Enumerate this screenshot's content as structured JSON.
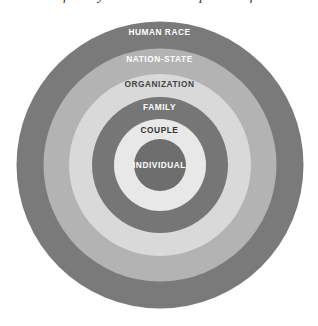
{
  "caption": {
    "text": "Figure 1.1  Levels of analysis: the nested spheres of human association"
  },
  "diagram": {
    "type": "concentric-circles",
    "rings": [
      {
        "id": "human-race",
        "label": "HUMAN RACE",
        "level": 1,
        "diameter_px": 287,
        "fill": "#7a7a7a",
        "text_color": "#ffffff",
        "label_offset_px": 6
      },
      {
        "id": "nation-state",
        "label": "NATION-STATE",
        "level": 2,
        "diameter_px": 233,
        "fill": "#b3b3b3",
        "text_color": "#ffffff",
        "label_offset_px": 6
      },
      {
        "id": "organization",
        "label": "ORGANIZATION",
        "level": 3,
        "diameter_px": 182,
        "fill": "#d9d9d9",
        "text_color": "#404040",
        "label_offset_px": 6
      },
      {
        "id": "family",
        "label": "FAMILY",
        "level": 4,
        "diameter_px": 136,
        "fill": "#767676",
        "text_color": "#ffffff",
        "label_offset_px": 6
      },
      {
        "id": "couple",
        "label": "COUPLE",
        "level": 5,
        "diameter_px": 92,
        "fill": "#e8e8e8",
        "text_color": "#333333",
        "label_offset_px": 7
      },
      {
        "id": "individual",
        "label": "INDIVIDUAL",
        "level": 6,
        "diameter_px": 52,
        "fill": "#6e6e6e",
        "text_color": "#ffffff",
        "label_offset_px": 0
      }
    ]
  }
}
